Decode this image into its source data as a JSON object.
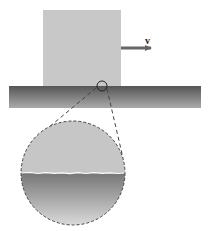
{
  "diagram": {
    "velocity_label": "v",
    "colors": {
      "block": "#c8c8c8",
      "slab_top": "#555555",
      "slab_bottom": "#aaaaaa",
      "arrow": "#666666",
      "magnify_top": "#c6c6c6",
      "magnify_bottom_top": "#767676",
      "magnify_bottom_bottom": "#dadada",
      "dash": "#444444"
    }
  }
}
